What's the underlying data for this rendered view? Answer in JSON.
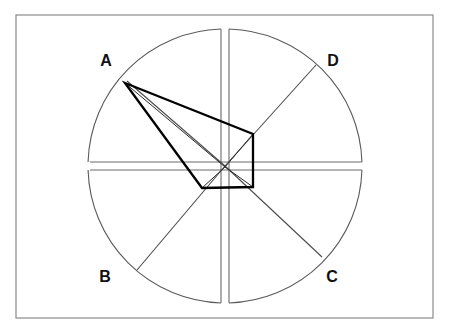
{
  "figure": {
    "background_color": "#ffffff",
    "frame": {
      "x": 16,
      "y": 15,
      "width": 417,
      "height": 303,
      "stroke_color": "#8a8a8a"
    },
    "circle": {
      "center_x": 225,
      "center_y": 166,
      "radius": 137,
      "stroke_color": "#5a5a5a"
    },
    "labels": [
      {
        "text": "A",
        "x": 106,
        "y": 62
      },
      {
        "text": "D",
        "x": 333,
        "y": 62
      },
      {
        "text": "B",
        "x": 105,
        "y": 278
      },
      {
        "text": "C",
        "x": 332,
        "y": 278
      }
    ],
    "slots": {
      "description": "Gaps splitting circle along vertical and horizontal axes",
      "gap_half_width": 4,
      "vertical_top_y": 29,
      "vertical_bottom_y": 303,
      "horizontal_left_x": 90,
      "horizontal_right_x": 362,
      "stroke_color": "#6a6a6a"
    },
    "spokes": [
      {
        "name": "spoke-to-A",
        "x1": 225,
        "y1": 166,
        "x2": 127,
        "y2": 81
      },
      {
        "name": "spoke-to-D",
        "x1": 225,
        "y1": 166,
        "x2": 316,
        "y2": 65
      },
      {
        "name": "spoke-to-B",
        "x1": 225,
        "y1": 166,
        "x2": 137,
        "y2": 270
      },
      {
        "name": "spoke-to-C",
        "x1": 225,
        "y1": 166,
        "x2": 322,
        "y2": 257
      }
    ],
    "bold_polygon": {
      "apex": {
        "x": 125,
        "y": 83
      },
      "vertices": [
        {
          "name": "apex-A",
          "x": 125,
          "y": 83
        },
        {
          "name": "upper-right",
          "x": 253,
          "y": 134
        },
        {
          "name": "lower-right",
          "x": 253,
          "y": 187
        },
        {
          "name": "lower-left",
          "x": 202,
          "y": 188
        }
      ],
      "stroke_color": "#000000",
      "stroke_width": 2.3
    },
    "thin_rays": [
      {
        "name": "apex-to-center",
        "x1": 125,
        "y1": 83,
        "x2": 225,
        "y2": 167
      },
      {
        "name": "center-to-upper-right",
        "x1": 225,
        "y1": 167,
        "x2": 253,
        "y2": 134
      },
      {
        "name": "center-to-lower-left",
        "x1": 225,
        "y1": 167,
        "x2": 202,
        "y2": 188
      },
      {
        "name": "center-to-lower-right",
        "x1": 225,
        "y1": 167,
        "x2": 253,
        "y2": 187
      }
    ]
  }
}
